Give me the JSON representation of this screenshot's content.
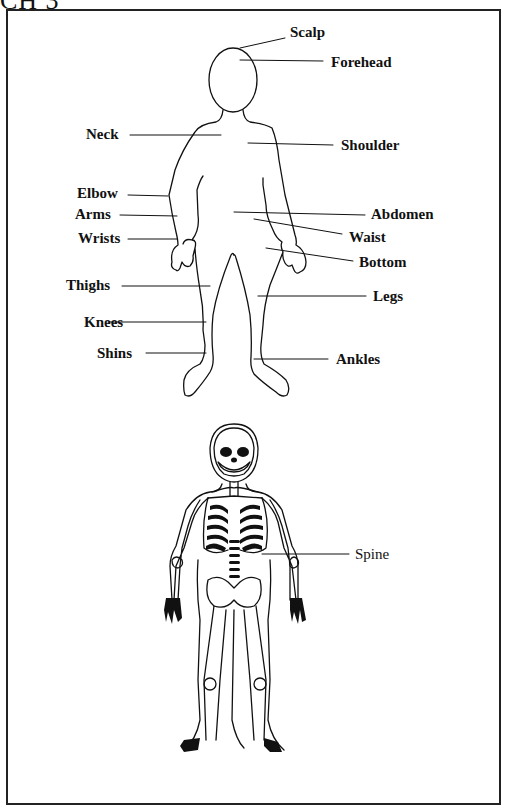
{
  "header": {
    "fragment": "CH 3"
  },
  "diagram": {
    "body_labels": {
      "scalp": "Scalp",
      "forehead": "Forehead",
      "neck": "Neck",
      "shoulder": "Shoulder",
      "elbow": "Elbow",
      "arms": "Arms",
      "wrists": "Wrists",
      "abdomen": "Abdomen",
      "waist": "Waist",
      "bottom": "Bottom",
      "thighs": "Thighs",
      "legs": "Legs",
      "knees": "Knees",
      "shins": "Shins",
      "ankles": "Ankles"
    },
    "skeleton_labels": {
      "spine": "Spine"
    }
  },
  "colors": {
    "ink": "#111111",
    "paper": "#ffffff",
    "frame": "#222222"
  }
}
